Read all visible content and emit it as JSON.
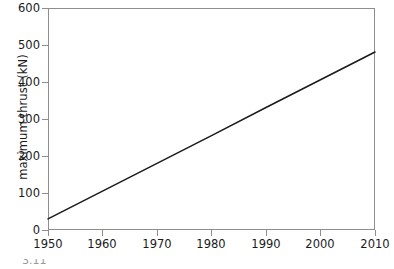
{
  "figure": {
    "caption_partial": "3.11"
  },
  "axes": {
    "y_title": "maximum thrust (kN)",
    "x_title": "",
    "y_ticks": [
      "0",
      "100",
      "200",
      "300",
      "400",
      "500",
      "600"
    ],
    "x_ticks": [
      "1950",
      "1960",
      "1970",
      "1980",
      "1990",
      "2000",
      "2010"
    ]
  },
  "style": {
    "frame_color": "#8e8e8e",
    "line_color": "#1a1a1a",
    "background": "#ffffff"
  },
  "chart_data": {
    "type": "line",
    "title": "",
    "subtitle": "",
    "xlabel": "",
    "ylabel": "maximum thrust (kN)",
    "xlim": [
      1950,
      2010
    ],
    "ylim": [
      0,
      600
    ],
    "xticks": [
      1950,
      1960,
      1970,
      1980,
      1990,
      2000,
      2010
    ],
    "yticks": [
      0,
      100,
      200,
      300,
      400,
      500,
      600
    ],
    "grid": false,
    "legend": null,
    "annotations": [],
    "series": [
      {
        "name": "maximum thrust",
        "x": [
          1950,
          1960,
          1970,
          1980,
          1990,
          2000,
          2010
        ],
        "values": [
          30,
          105,
          180,
          255,
          331,
          406,
          481
        ]
      }
    ]
  }
}
